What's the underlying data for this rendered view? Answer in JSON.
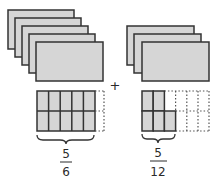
{
  "colors": {
    "fill": "#d6d6d6",
    "stroke": "#333333",
    "dashed": "#555555",
    "text": "#2a2a2a"
  },
  "left_group": {
    "whole_cards": 5,
    "grid": {
      "columns": 6,
      "rows": 2,
      "shaded_cells": 10
    },
    "fraction": {
      "numerator": "5",
      "denominator": "6"
    }
  },
  "operator": "+",
  "right_group": {
    "whole_cards": 3,
    "grid": {
      "columns": 6,
      "rows": 2,
      "shaded_cells": 5
    },
    "fraction": {
      "numerator": "5",
      "denominator": "12"
    }
  }
}
